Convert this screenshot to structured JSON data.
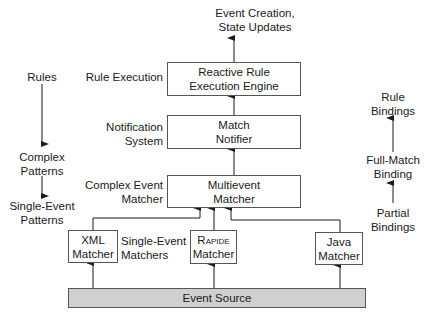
{
  "top_output": {
    "line1": "Event Creation,",
    "line2": "State Updates"
  },
  "boxes": {
    "reactive": {
      "line1": "Reactive Rule",
      "line2": "Execution Engine"
    },
    "notifier": {
      "line1": "Match",
      "line2": "Notifier"
    },
    "multievent": {
      "line1": "Multievent",
      "line2": "Matcher"
    },
    "xml": {
      "line1": "XML",
      "line2": "Matcher"
    },
    "rapide": {
      "line1": "Rapide",
      "line2": "Matcher"
    },
    "java": {
      "line1": "Java",
      "line2": "Matcher"
    },
    "source": {
      "label": "Event Source"
    }
  },
  "layer_labels": {
    "rule_execution": "Rule Execution",
    "notification": {
      "line1": "Notification",
      "line2": "System"
    },
    "complex_event": {
      "line1": "Complex Event",
      "line2": "Matcher"
    },
    "single_event": {
      "line1": "Single-Event",
      "line2": "Matchers"
    }
  },
  "left_column": {
    "rules": "Rules",
    "complex": {
      "line1": "Complex",
      "line2": "Patterns"
    },
    "single": {
      "line1": "Single-Event",
      "line2": "Patterns"
    }
  },
  "right_column": {
    "rule_bindings": {
      "line1": "Rule",
      "line2": "Bindings"
    },
    "full_match": {
      "line1": "Full-Match",
      "line2": "Binding"
    },
    "partial": {
      "line1": "Partial",
      "line2": "Bindings"
    }
  },
  "colors": {
    "line": "#1a1a1a",
    "box_border": "#555555",
    "source_fill": "#d0d0d0"
  }
}
